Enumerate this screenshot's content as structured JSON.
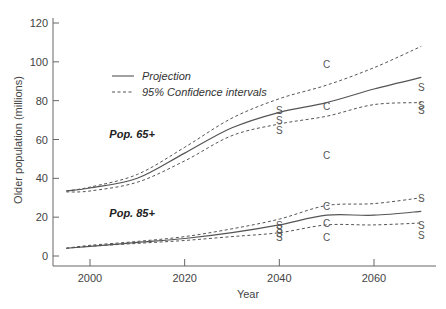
{
  "chart_data": {
    "type": "line",
    "title": "",
    "xlabel": "Year",
    "ylabel": "Older population (millions)",
    "xlim": [
      1995,
      2070
    ],
    "ylim": [
      0,
      120
    ],
    "xticks": [
      2000,
      2020,
      2040,
      2060
    ],
    "yticks": [
      0,
      20,
      40,
      60,
      80,
      100,
      120
    ],
    "grid": false,
    "legend": {
      "position": "upper-left",
      "entries": [
        {
          "label": "Projection",
          "style": "solid"
        },
        {
          "label": "95% Confidence intervals",
          "style": "dashed"
        }
      ]
    },
    "x": [
      1995,
      2000,
      2010,
      2020,
      2030,
      2040,
      2050,
      2060,
      2070
    ],
    "series": [
      {
        "name": "Pop. 65+ projection",
        "style": "solid",
        "values": [
          33.5,
          35,
          40,
          53,
          66,
          74,
          79,
          86,
          92
        ]
      },
      {
        "name": "Pop. 65+ upper 95% CI",
        "style": "dashed",
        "values": [
          33.5,
          35.5,
          42,
          56,
          71,
          81,
          88,
          97,
          108
        ]
      },
      {
        "name": "Pop. 65+ lower 95% CI",
        "style": "dashed",
        "values": [
          33,
          33.5,
          38,
          49,
          62,
          68,
          72,
          78,
          79
        ]
      },
      {
        "name": "Pop. 85+ projection",
        "style": "solid",
        "values": [
          4,
          5,
          7,
          9,
          12,
          16,
          21,
          21,
          23
        ]
      },
      {
        "name": "Pop. 85+ upper 95% CI",
        "style": "dashed",
        "values": [
          4,
          5.5,
          7.5,
          10,
          14,
          19,
          26,
          27,
          30
        ]
      },
      {
        "name": "Pop. 85+ lower 95% CI",
        "style": "dashed",
        "values": [
          4,
          5,
          6.5,
          8,
          10,
          12,
          16,
          16,
          17
        ]
      }
    ],
    "series_labels": [
      {
        "text": "Pop. 65+",
        "x": 2010,
        "y": 63
      },
      {
        "text": "Pop. 85+",
        "x": 2010,
        "y": 22
      }
    ],
    "markers": [
      {
        "symbol": "S",
        "x": 2040,
        "y": 75
      },
      {
        "symbol": "S",
        "x": 2040,
        "y": 70
      },
      {
        "symbol": "S",
        "x": 2040,
        "y": 65
      },
      {
        "symbol": "C",
        "x": 2050,
        "y": 99
      },
      {
        "symbol": "C",
        "x": 2050,
        "y": 77
      },
      {
        "symbol": "C",
        "x": 2050,
        "y": 52
      },
      {
        "symbol": "S",
        "x": 2070,
        "y": 87
      },
      {
        "symbol": "S",
        "x": 2070,
        "y": 78
      },
      {
        "symbol": "S",
        "x": 2070,
        "y": 75
      },
      {
        "symbol": "S",
        "x": 2040,
        "y": 16
      },
      {
        "symbol": "S",
        "x": 2040,
        "y": 14
      },
      {
        "symbol": "S",
        "x": 2040,
        "y": 12
      },
      {
        "symbol": "S",
        "x": 2040,
        "y": 10
      },
      {
        "symbol": "C",
        "x": 2050,
        "y": 26
      },
      {
        "symbol": "C",
        "x": 2050,
        "y": 17
      },
      {
        "symbol": "C",
        "x": 2050,
        "y": 10
      },
      {
        "symbol": "S",
        "x": 2070,
        "y": 30
      },
      {
        "symbol": "S",
        "x": 2070,
        "y": 16
      },
      {
        "symbol": "S",
        "x": 2070,
        "y": 11
      }
    ]
  }
}
